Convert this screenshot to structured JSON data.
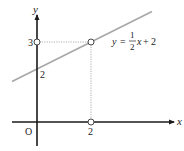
{
  "diagram": {
    "axes": {
      "x_label": "x",
      "y_label": "y",
      "origin_label": "O"
    },
    "ticks": {
      "x_tick": "2",
      "y_tick_3": "3",
      "y_tick_2": "2"
    },
    "equation": {
      "lhs": "y",
      "equals": "=",
      "frac_num": "1",
      "frac_den": "2",
      "var": "x",
      "plus": "+",
      "const": "2"
    },
    "points": [
      {
        "name": "y-intercept-3",
        "x": 0,
        "y": 3
      },
      {
        "name": "point-2-3",
        "x": 2,
        "y": 3
      },
      {
        "name": "point-2-0",
        "x": 2,
        "y": 0
      }
    ],
    "colors": {
      "axis": "#1a1a1a",
      "line": "#a6a6a6",
      "guide": "#9a9a9a",
      "text": "#222222"
    }
  }
}
